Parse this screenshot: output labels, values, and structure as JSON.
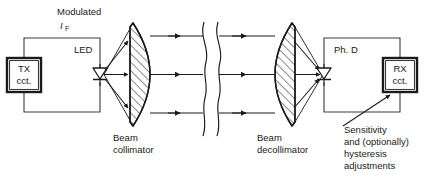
{
  "diagram": {
    "labels": {
      "modulated": "Modulated",
      "current_symbol": "I",
      "current_subscript": "F",
      "led": "LED",
      "photodiode": "Ph. D",
      "beam_collimator_line1": "Beam",
      "beam_collimator_line2": "collimator",
      "beam_decollimator_line1": "Beam",
      "beam_decollimator_line2": "decollimator",
      "adjustments_line1": "Sensitivity",
      "adjustments_line2": "and (optionally)",
      "adjustments_line3": "hysteresis",
      "adjustments_line4": "adjustments"
    },
    "blocks": [
      {
        "id": "tx",
        "line1": "TX",
        "line2": "cct."
      },
      {
        "id": "rx",
        "line1": "RX",
        "line2": "cct."
      }
    ],
    "colors": {
      "ink": "#1a1a1a",
      "wire": "#3a3a3a",
      "background": "#ffffff",
      "hatch": "#2b2b2b"
    }
  }
}
